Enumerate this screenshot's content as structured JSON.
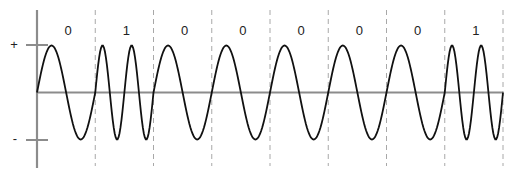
{
  "diagram": {
    "type": "FSK waveform",
    "bits": [
      "0",
      "1",
      "0",
      "0",
      "0",
      "0",
      "0",
      "1"
    ],
    "cycles_per_bit": {
      "0": 1,
      "1": 2
    },
    "y_axis_labels": {
      "positive": "+",
      "negative": "-"
    },
    "colors": {
      "axis": "#8c8c8c",
      "wave": "#111111",
      "divider": "#a8a8a8",
      "text": "#222222"
    }
  }
}
